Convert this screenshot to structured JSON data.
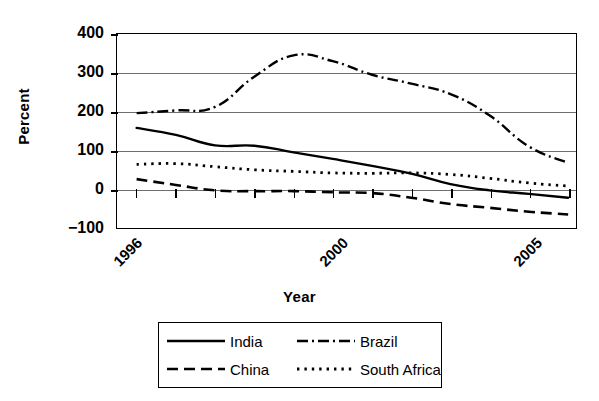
{
  "chart_data": {
    "type": "line",
    "title": "",
    "xlabel": "Year",
    "ylabel": "Percent",
    "xlim": [
      1995.5,
      2007.2
    ],
    "ylim": [
      -100,
      400
    ],
    "yticks": [
      400,
      300,
      200,
      100,
      0,
      -100
    ],
    "ytick_labels": [
      "400",
      "300",
      "200",
      "100",
      "0",
      "−100"
    ],
    "xticks": [
      1996,
      1997,
      1998,
      1999,
      2000,
      2001,
      2002,
      2003,
      2004,
      2005,
      2006,
      2007
    ],
    "xtick_labels_shown": [
      "1996",
      "2000",
      "2005"
    ],
    "x": [
      1996,
      1997,
      1998,
      1999,
      2000,
      2001,
      2002,
      2003,
      2004,
      2005,
      2006,
      2007
    ],
    "grid": "horizontal",
    "legend_position": "below-center",
    "series": [
      {
        "name": "India",
        "style": "solid",
        "values": [
          158,
          140,
          113,
          112,
          95,
          78,
          60,
          40,
          13,
          -3,
          -12,
          -22
        ]
      },
      {
        "name": "Brazil",
        "style": "dash-dot",
        "values": [
          196,
          203,
          212,
          290,
          345,
          330,
          295,
          272,
          245,
          190,
          110,
          68
        ]
      },
      {
        "name": "China",
        "style": "dashed",
        "values": [
          26,
          11,
          -3,
          -5,
          -5,
          -8,
          -10,
          -22,
          -38,
          -48,
          -58,
          -65
        ]
      },
      {
        "name": "South Africa",
        "style": "dotted",
        "values": [
          64,
          66,
          58,
          50,
          46,
          42,
          41,
          42,
          38,
          28,
          16,
          8
        ]
      }
    ]
  },
  "axes": {
    "ylabel": "Percent",
    "xlabel": "Year",
    "ytick_labels": [
      "400",
      "300",
      "200",
      "100",
      "0",
      "−100"
    ],
    "xtick_labels": [
      "1996",
      "2000",
      "2005"
    ]
  },
  "legend": {
    "entries": [
      {
        "label": "India",
        "style": "solid"
      },
      {
        "label": "Brazil",
        "style": "dash-dot"
      },
      {
        "label": "China",
        "style": "dashed"
      },
      {
        "label": "South Africa",
        "style": "dotted"
      }
    ]
  }
}
